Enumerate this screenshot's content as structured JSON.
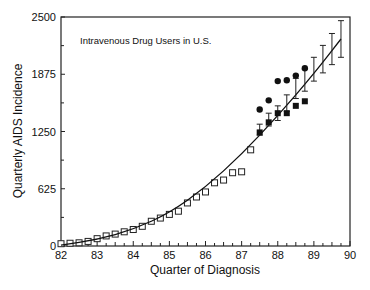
{
  "chart_data": {
    "type": "scatter",
    "title": "",
    "annotation": "Intravenous Drug Users in U.S.",
    "xlabel": "Quarter of Diagnosis",
    "ylabel": "Quarterly AIDS Incidence",
    "xlim": [
      82,
      90
    ],
    "ylim": [
      0,
      2500
    ],
    "xticks": [
      82,
      83,
      84,
      85,
      86,
      87,
      88,
      89,
      90
    ],
    "yticks": [
      0,
      625,
      1250,
      1875,
      2500
    ],
    "grid": false,
    "legend": null,
    "series": [
      {
        "name": "observed",
        "marker": "open-square",
        "x": [
          82.0,
          82.25,
          82.5,
          82.75,
          83.0,
          83.25,
          83.5,
          83.75,
          84.0,
          84.25,
          84.5,
          84.75,
          85.0,
          85.25,
          85.5,
          85.75,
          86.0,
          86.25,
          86.5,
          86.75,
          87.0,
          87.25
        ],
        "y": [
          25,
          30,
          35,
          50,
          80,
          110,
          130,
          155,
          180,
          215,
          270,
          305,
          345,
          380,
          470,
          535,
          590,
          690,
          720,
          800,
          810,
          1050
        ]
      },
      {
        "name": "fitted trend",
        "marker": "line",
        "x": [
          82.0,
          83.0,
          84.0,
          85.0,
          86.0,
          87.0,
          88.0,
          89.0,
          89.75
        ],
        "y": [
          10,
          70,
          180,
          360,
          640,
          1000,
          1420,
          1880,
          2260
        ]
      },
      {
        "name": "projection with error bars",
        "marker": "errorbar",
        "x": [
          87.5,
          87.75,
          88.0,
          88.25,
          88.5,
          88.75,
          89.0,
          89.25,
          89.5,
          89.75
        ],
        "y": [
          1270,
          1380,
          1450,
          1560,
          1720,
          1810,
          1930,
          2040,
          2150,
          2260
        ],
        "yerr_low": [
          60,
          70,
          80,
          90,
          110,
          120,
          130,
          150,
          170,
          200
        ],
        "yerr_high": [
          60,
          70,
          80,
          90,
          110,
          120,
          130,
          150,
          170,
          200
        ]
      },
      {
        "name": "reported (filled circle)",
        "marker": "filled-circle",
        "x": [
          87.5,
          87.75,
          88.0,
          88.25,
          88.5,
          88.75
        ],
        "y": [
          1490,
          1590,
          1800,
          1810,
          1860,
          1940
        ]
      },
      {
        "name": "reported (filled square)",
        "marker": "filled-square",
        "x": [
          87.5,
          87.75,
          88.0,
          88.25,
          88.5,
          88.75
        ],
        "y": [
          1240,
          1350,
          1450,
          1450,
          1530,
          1580
        ]
      }
    ]
  }
}
